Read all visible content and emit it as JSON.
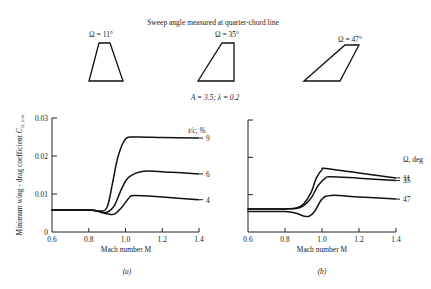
{
  "figure": {
    "header": "Sweep angle measured at quarter-chord line",
    "planform_params": "A = 3.5; λ = 0.2",
    "planforms": [
      {
        "label": "Ω = 11°",
        "sweep_deg": 11
      },
      {
        "label": "Ω = 35°",
        "sweep_deg": 35
      },
      {
        "label": "Ω = 47°",
        "sweep_deg": 47
      }
    ]
  },
  "chart_data": [
    {
      "type": "line",
      "panel": "(a)",
      "title": "",
      "xlabel": "Mach number M",
      "ylabel": "Minimum wing - drag coefficient C_D, min",
      "xlim": [
        0.6,
        1.4
      ],
      "ylim": [
        0,
        0.03
      ],
      "xticks": [
        "0.6",
        "0.8",
        "1.0",
        "1.2",
        "1.4"
      ],
      "yticks": [
        "0",
        "0.01",
        "0.02",
        "0.03"
      ],
      "legend_title": "t/c, %",
      "legend_placement": "right",
      "grid": false,
      "series": [
        {
          "name": "9",
          "x": [
            0.6,
            0.8,
            0.86,
            0.9,
            0.93,
            0.96,
            1.0,
            1.05,
            1.2,
            1.4
          ],
          "y": [
            0.0058,
            0.0058,
            0.0055,
            0.0065,
            0.013,
            0.02,
            0.0245,
            0.025,
            0.0249,
            0.0247
          ]
        },
        {
          "name": "6",
          "x": [
            0.6,
            0.8,
            0.86,
            0.9,
            0.94,
            0.98,
            1.02,
            1.1,
            1.25,
            1.4
          ],
          "y": [
            0.0058,
            0.0058,
            0.0054,
            0.0052,
            0.007,
            0.0115,
            0.0145,
            0.016,
            0.0157,
            0.0153
          ]
        },
        {
          "name": "4",
          "x": [
            0.6,
            0.8,
            0.86,
            0.9,
            0.94,
            0.98,
            1.02,
            1.05,
            1.2,
            1.4
          ],
          "y": [
            0.0058,
            0.0058,
            0.0053,
            0.0048,
            0.0047,
            0.0065,
            0.009,
            0.0096,
            0.0092,
            0.0085
          ]
        }
      ]
    },
    {
      "type": "line",
      "panel": "(b)",
      "title": "",
      "xlabel": "Mach number M",
      "ylabel": "",
      "xlim": [
        0.6,
        1.4
      ],
      "ylim": [
        0,
        0.03
      ],
      "xticks": [
        "0.6",
        "0.8",
        "1.0",
        "1.2",
        "1.4"
      ],
      "yticks": [
        "",
        "",
        "",
        ""
      ],
      "legend_title": "Ω, deg",
      "legend_placement": "right",
      "grid": false,
      "series": [
        {
          "name": "11",
          "x": [
            0.6,
            0.8,
            0.86,
            0.9,
            0.94,
            0.97,
            1.0,
            1.02,
            1.2,
            1.4
          ],
          "y": [
            0.0062,
            0.0062,
            0.0064,
            0.0075,
            0.0105,
            0.0145,
            0.0167,
            0.017,
            0.0158,
            0.0145
          ]
        },
        {
          "name": "35",
          "x": [
            0.6,
            0.8,
            0.86,
            0.9,
            0.94,
            0.98,
            1.02,
            1.05,
            1.2,
            1.4
          ],
          "y": [
            0.0062,
            0.0062,
            0.0063,
            0.007,
            0.009,
            0.0125,
            0.0145,
            0.0148,
            0.0144,
            0.0138
          ]
        },
        {
          "name": "47",
          "x": [
            0.6,
            0.8,
            0.86,
            0.9,
            0.93,
            0.96,
            1.0,
            1.05,
            1.2,
            1.4
          ],
          "y": [
            0.0055,
            0.0055,
            0.005,
            0.0043,
            0.0042,
            0.0055,
            0.0088,
            0.0098,
            0.0094,
            0.0088
          ]
        }
      ]
    }
  ]
}
